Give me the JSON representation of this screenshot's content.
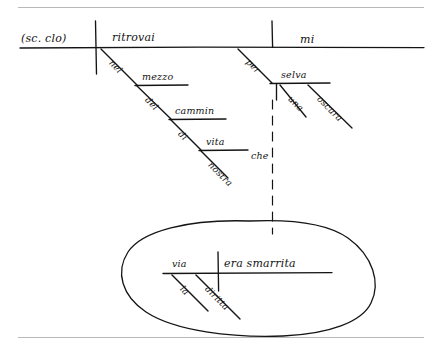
{
  "document": {
    "type": "handwritten-sentence-diagram",
    "language": "Italian",
    "ink_color": "#141414",
    "rule_color": "#b8b8b8",
    "background_color": "#ffffff"
  },
  "rules": {
    "top_label": "top-horizontal-rule",
    "bottom_label": "bottom-horizontal-rule"
  },
  "main_clause": {
    "subject": "(sc. clo)",
    "verb": "ritrovai",
    "object": "mi",
    "verb_modifiers": [
      {
        "preposition": "nel",
        "object": "mezzo"
      },
      {
        "preposition": "del",
        "object": "cammin"
      },
      {
        "preposition": "di",
        "object": "vita"
      },
      {
        "modifier": "nostra"
      }
    ],
    "object_modifiers": [
      {
        "preposition": "per",
        "object": "selva"
      },
      {
        "modifier": "una"
      },
      {
        "modifier": "oscura"
      }
    ]
  },
  "relative_clause": {
    "connector": "che",
    "subject": "via",
    "verb": "era smarrita",
    "subject_modifiers": [
      "la",
      "diritta"
    ]
  },
  "words": {
    "sc_clo": "(sc. clo)",
    "ritrovai": "ritrovai",
    "mi": "mi",
    "nel": "nel",
    "mezzo": "mezzo",
    "del": "del",
    "cammin": "cammin",
    "di": "di",
    "vita": "vita",
    "nostra": "nostra",
    "per": "per",
    "selva": "selva",
    "una": "una",
    "oscura": "oscura",
    "che": "che",
    "via": "via",
    "era_smarrita": "era smarrita",
    "la": "la",
    "diritta": "diritta"
  }
}
